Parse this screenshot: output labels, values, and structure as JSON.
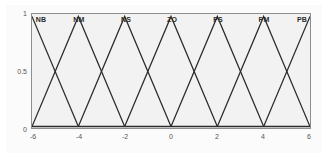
{
  "chart_data": {
    "type": "line",
    "title": "",
    "subtitle": "",
    "xlabel": "",
    "ylabel": "",
    "xlim": [
      -6,
      6
    ],
    "ylim": [
      0,
      1
    ],
    "grid": false,
    "legend_position": "inside-top",
    "xticks": [
      -6,
      -4,
      -2,
      0,
      2,
      4,
      6
    ],
    "xticklabels": [
      "-6",
      "-4",
      "-2",
      "0",
      "2",
      "4",
      "6"
    ],
    "yticks": [
      0,
      0.5,
      1
    ],
    "yticklabels": [
      "0",
      "0.5",
      "1"
    ],
    "annotations": [
      "NB",
      "NM",
      "NS",
      "ZO",
      "PS",
      "PM",
      "PB"
    ],
    "series": [
      {
        "name": "NB",
        "peak": -6,
        "left": -8,
        "right": -4,
        "x": [
          -6,
          -4
        ],
        "values": [
          1,
          0
        ]
      },
      {
        "name": "NM",
        "peak": -4,
        "left": -6,
        "right": -2,
        "x": [
          -6,
          -4,
          -2
        ],
        "values": [
          0,
          1,
          0
        ]
      },
      {
        "name": "NS",
        "peak": -2,
        "left": -4,
        "right": 0,
        "x": [
          -4,
          -2,
          0
        ],
        "values": [
          0,
          1,
          0
        ]
      },
      {
        "name": "ZO",
        "peak": 0,
        "left": -2,
        "right": 2,
        "x": [
          -2,
          0,
          2
        ],
        "values": [
          0,
          1,
          0
        ]
      },
      {
        "name": "PS",
        "peak": 2,
        "left": 0,
        "right": 4,
        "x": [
          0,
          2,
          4
        ],
        "values": [
          0,
          1,
          0
        ]
      },
      {
        "name": "PM",
        "peak": 4,
        "left": 2,
        "right": 6,
        "x": [
          2,
          4,
          6
        ],
        "values": [
          0,
          1,
          0
        ]
      },
      {
        "name": "PB",
        "peak": 6,
        "left": 4,
        "right": 8,
        "x": [
          4,
          6
        ],
        "values": [
          0,
          1
        ]
      }
    ],
    "colors": {
      "line": "#2b2b2b",
      "axis": "#8e8e8e",
      "plot_background": "#f2f2f2",
      "figure_background": "#ffffff",
      "tick_text": "#555555",
      "label_text": "#2b2b2b"
    }
  }
}
